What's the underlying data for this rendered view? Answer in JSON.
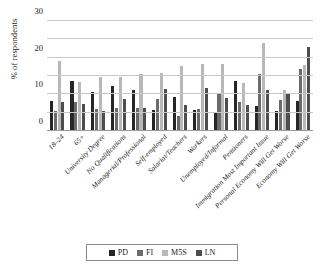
{
  "chart_data": {
    "type": "bar",
    "title": "",
    "subtitle": "",
    "xlabel": "",
    "ylabel": "% of respondents",
    "ylim": [
      0,
      60
    ],
    "ytick_values": [
      0,
      10,
      20,
      30,
      40,
      50,
      60
    ],
    "ytick_labels": [
      "0",
      "10",
      "20",
      "30",
      "40",
      "50",
      "60"
    ],
    "grid": "horizontal",
    "legend_position": "bottom",
    "categories": [
      "18–24",
      "65+",
      "University Degree",
      "No Qualifications",
      "Managerial/Professional",
      "Self-employed",
      "Salariat/Teachers",
      "Workers",
      "Unemployed/Informal",
      "Pensioners",
      "Immigration Most Important Issue",
      "Personal Economy Will Get Worse",
      "Economy Will Get Worse"
    ],
    "series": [
      {
        "name": "PD",
        "color": "#262626",
        "values": [
          16.5,
          27.5,
          21.5,
          24.5,
          22.2,
          11.3,
          18.5,
          11.5,
          10.5,
          27.5,
          13.5,
          10.7,
          16.3
        ]
      },
      {
        "name": "FI",
        "color": "#6b6b6b",
        "values": [
          10.8,
          16.0,
          12.0,
          12.5,
          12.8,
          17.5,
          8.3,
          12.0,
          20.0,
          16.0,
          31.0,
          16.8,
          33.8
        ]
      },
      {
        "name": "M5S",
        "color": "#b8b8b8",
        "values": [
          38.2,
          27.0,
          29.3,
          29.7,
          31.2,
          31.5,
          35.5,
          36.3,
          36.3,
          26.0,
          48.0,
          22.2,
          36.2
        ]
      },
      {
        "name": "LN",
        "color": "#4d4d4d",
        "values": [
          16.0,
          14.5,
          11.0,
          17.7,
          12.5,
          23.0,
          14.2,
          23.2,
          18.0,
          14.0,
          22.5,
          20.5,
          45.7
        ]
      }
    ]
  },
  "legend": {
    "entries": [
      {
        "label": "PD",
        "swatch_color": "#262626"
      },
      {
        "label": "FI",
        "swatch_color": "#6b6b6b"
      },
      {
        "label": "M5S",
        "swatch_color": "#b8b8b8"
      },
      {
        "label": "LN",
        "swatch_color": "#4d4d4d"
      }
    ]
  },
  "axes": {
    "y_title": "% of respondents"
  }
}
